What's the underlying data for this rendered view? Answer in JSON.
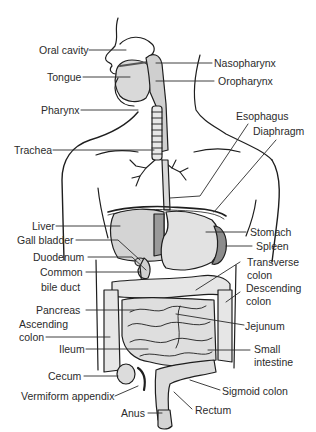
{
  "diagram": {
    "title_faint": "",
    "colors": {
      "line": "#1e1e1e",
      "organ_fill": "#d9d9d9",
      "organ_fill_dark": "#9a9a9a",
      "background": "#ffffff",
      "label_text": "#2b2b2b"
    },
    "labels_left": [
      {
        "id": "oral-cavity",
        "text": "Oral cavity"
      },
      {
        "id": "tongue",
        "text": "Tongue"
      },
      {
        "id": "pharynx",
        "text": "Pharynx"
      },
      {
        "id": "trachea",
        "text": "Trachea"
      },
      {
        "id": "liver",
        "text": "Liver"
      },
      {
        "id": "gall-bladder",
        "text": "Gall bladder"
      },
      {
        "id": "duodenum",
        "text": "Duodenum"
      },
      {
        "id": "common-bile-duct",
        "text": "Common",
        "text2": "bile duct"
      },
      {
        "id": "pancreas",
        "text": "Pancreas"
      },
      {
        "id": "ascending-colon",
        "text": "Ascending",
        "text2": "colon"
      },
      {
        "id": "ileum",
        "text": "Ileum"
      },
      {
        "id": "cecum",
        "text": "Cecum"
      },
      {
        "id": "vermiform-appendix",
        "text": "Vermiform appendix"
      },
      {
        "id": "anus",
        "text": "Anus"
      }
    ],
    "labels_right": [
      {
        "id": "nasopharynx",
        "text": "Nasopharynx"
      },
      {
        "id": "oropharynx",
        "text": "Oropharynx"
      },
      {
        "id": "esophagus",
        "text": "Esophagus"
      },
      {
        "id": "diaphragm",
        "text": "Diaphragm"
      },
      {
        "id": "stomach",
        "text": "Stomach"
      },
      {
        "id": "spleen",
        "text": "Spleen"
      },
      {
        "id": "transverse-colon",
        "text": "Transverse",
        "text2": "colon"
      },
      {
        "id": "descending-colon",
        "text": "Descending",
        "text2": "colon"
      },
      {
        "id": "jejunum",
        "text": "Jejunum"
      },
      {
        "id": "small-intestine",
        "text": "Small",
        "text2": "intestine"
      },
      {
        "id": "sigmoid-colon",
        "text": "Sigmoid colon"
      },
      {
        "id": "rectum",
        "text": "Rectum"
      }
    ]
  }
}
